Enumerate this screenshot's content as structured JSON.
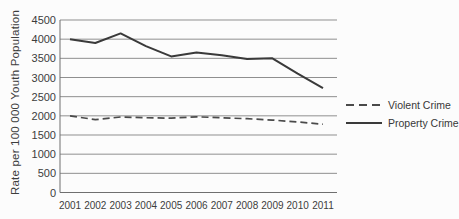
{
  "figure": {
    "background": "#fcfcfc"
  },
  "legend": {
    "items": [
      {
        "label": "Violent Crime",
        "style": "dashed"
      },
      {
        "label": "Property Crime",
        "style": "solid"
      }
    ]
  },
  "chart_data": {
    "type": "line",
    "title": "",
    "xlabel": "",
    "ylabel": "Rate per 100 000 Youth Population",
    "x": [
      2001,
      2002,
      2003,
      2004,
      2005,
      2006,
      2007,
      2008,
      2009,
      2010,
      2011
    ],
    "series": [
      {
        "name": "Violent Crime",
        "style": "dashed",
        "values": [
          2000,
          1900,
          1970,
          1950,
          1940,
          1975,
          1950,
          1925,
          1890,
          1840,
          1780
        ]
      },
      {
        "name": "Property Crime",
        "style": "solid",
        "values": [
          4000,
          3900,
          4150,
          3820,
          3550,
          3650,
          3580,
          3480,
          3500,
          3100,
          2720
        ]
      }
    ],
    "ylim": [
      0,
      4500
    ],
    "yticks": [
      0,
      500,
      1000,
      1500,
      2000,
      2500,
      3000,
      3500,
      4000,
      4500
    ],
    "grid": true,
    "legend_position": "right",
    "colors": {
      "solid_line": "#3a3a3a",
      "dashed_line": "#4a4a4a",
      "grid": "#8f8f8f",
      "axis": "#6f6f6f",
      "text": "#3d3d3d"
    }
  }
}
